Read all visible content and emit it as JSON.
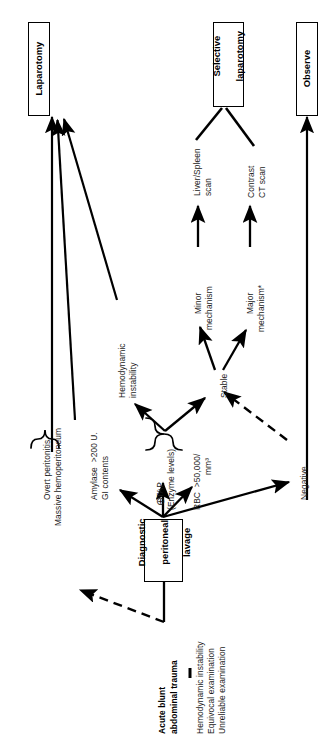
{
  "diagram": {
    "orientation": "rotated-90-counterclockwise",
    "footnote_marker": "*",
    "boxes": [
      {
        "id": "laparotomy",
        "label": "Laparotomy"
      },
      {
        "id": "selective-laparotomy",
        "label": "Selective\nlaparotomy"
      },
      {
        "id": "observe",
        "label": "Observe"
      },
      {
        "id": "dpl",
        "label": "Diagnostic\nperitoneal\nlavage"
      }
    ],
    "labels": [
      {
        "id": "overt-peritonitis",
        "text": "Overt peritonitis"
      },
      {
        "id": "massive-hemoperitoneum",
        "text": "Massive hemoperitoneum"
      },
      {
        "id": "amylase",
        "text": "Amylase  >200 U."
      },
      {
        "id": "gi-contents",
        "text": "GI contents"
      },
      {
        "id": "tap",
        "text": "TAP"
      },
      {
        "id": "enzyme-levels",
        "text": "(Enzyme levels)"
      },
      {
        "id": "rbc",
        "text": "RBC  >50,000/"
      },
      {
        "id": "rbc-units",
        "text": "mm³"
      },
      {
        "id": "hemodynamic-instability",
        "text": "Hemodynamic\ninstability"
      },
      {
        "id": "stable",
        "text": "Stable"
      },
      {
        "id": "negative",
        "text": "Negative"
      },
      {
        "id": "minor-mechanism",
        "text": "Minor\nmechanism"
      },
      {
        "id": "major-mechanism",
        "text": "Major\nmechanism*"
      },
      {
        "id": "liver-spleen-scan",
        "text": "Liver/Spleen\nscan"
      },
      {
        "id": "contrast-ct-scan",
        "text": "Contrast\nCT scan"
      },
      {
        "id": "acute-blunt-abdominal-trauma",
        "text": "Acute blunt\nabdominal trauma"
      },
      {
        "id": "criteria-hemodynamic",
        "text": "Hemodynamic instability"
      },
      {
        "id": "criteria-equivocal",
        "text": "Equivocal examination"
      },
      {
        "id": "criteria-unreliable",
        "text": "Unreliable examination"
      },
      {
        "id": "plus-sign",
        "text": "⊕"
      }
    ],
    "text": {
      "laparotomy": "Laparotomy",
      "selective_laparotomy_line1": "Selective",
      "selective_laparotomy_line2": "laparotomy",
      "observe": "Observe",
      "dpl_line1": "Diagnostic",
      "dpl_line2": "peritoneal",
      "dpl_line3": "lavage",
      "overt_peritonitis": "Overt peritonitis",
      "massive_hemoperitoneum": "Massive hemoperitoneum",
      "amylase": "Amylase  >200 U.",
      "gi_contents": "GI contents",
      "plus": "⊕",
      "tap": "TAP",
      "enzyme_levels": "(Enzyme levels)",
      "rbc": "RBC  >50,000/",
      "rbc_units": "mm³",
      "hemodynamic_line1": "Hemodynamic",
      "hemodynamic_line2": "instability",
      "stable": "Stable",
      "negative": "Negative",
      "minor_line1": "Minor",
      "minor_line2": "mechanism",
      "major_line1": "Major",
      "major_line2": "mechanism*",
      "liver_spleen_line1": "Liver/Spleen",
      "liver_spleen_line2": "scan",
      "contrast_ct_line1": "Contrast",
      "contrast_ct_line2": "CT scan",
      "acute_line1": "Acute blunt",
      "acute_line2": "abdominal trauma",
      "criteria_1": "Hemodynamic instability",
      "criteria_2": "Equivocal examination",
      "criteria_3": "Unreliable examination"
    },
    "edges": [
      {
        "from": "overt-peritonitis-group",
        "to": "laparotomy",
        "style": "solid"
      },
      {
        "from": "amylase-gi-contents",
        "to": "laparotomy",
        "style": "solid"
      },
      {
        "from": "hemodynamic-instability",
        "to": "laparotomy",
        "style": "solid"
      },
      {
        "from": "acute-blunt-abdominal-trauma",
        "to": "dpl",
        "style": "solid"
      },
      {
        "from": "acute-blunt-abdominal-trauma",
        "to": "overt-peritonitis-group",
        "style": "dashed"
      },
      {
        "from": "dpl",
        "to": "amylase-gi-contents",
        "style": "solid"
      },
      {
        "from": "dpl",
        "to": "tap",
        "style": "solid"
      },
      {
        "from": "dpl",
        "to": "rbc",
        "style": "solid"
      },
      {
        "from": "dpl",
        "to": "negative",
        "style": "solid"
      },
      {
        "from": "enzyme-brace",
        "to": "hemodynamic-instability",
        "style": "solid"
      },
      {
        "from": "enzyme-brace",
        "to": "stable",
        "style": "solid"
      },
      {
        "from": "negative",
        "to": "stable",
        "style": "dashed"
      },
      {
        "from": "stable",
        "to": "minor-mechanism",
        "style": "solid"
      },
      {
        "from": "stable",
        "to": "major-mechanism",
        "style": "solid"
      },
      {
        "from": "minor-mechanism",
        "to": "liver-spleen-scan",
        "style": "solid"
      },
      {
        "from": "major-mechanism",
        "to": "contrast-ct-scan",
        "style": "solid"
      },
      {
        "from": "liver-spleen-scan",
        "to": "selective-laparotomy",
        "style": "solid"
      },
      {
        "from": "contrast-ct-scan",
        "to": "selective-laparotomy",
        "style": "solid"
      },
      {
        "from": "negative",
        "to": "observe",
        "style": "solid"
      }
    ],
    "colors": {
      "background": "#ffffff",
      "stroke": "#000000",
      "text": "#1a1a1a"
    }
  }
}
